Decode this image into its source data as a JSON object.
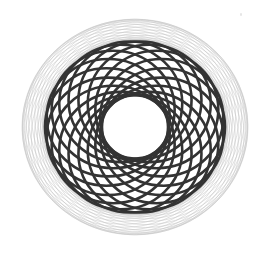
{
  "image": {
    "width": 269,
    "height": 253,
    "background": "#ffffff",
    "subject": "spirograph rosette pattern"
  },
  "rosette": {
    "center": [
      135,
      127
    ],
    "scale_y": 0.955,
    "outer_faint": {
      "count": 22,
      "circle_radius": 102,
      "offset_radius": 11,
      "stroke": "#c4c4c4",
      "stroke_width": 0.7,
      "opacity": 0.75
    },
    "inner_dark": {
      "count": 18,
      "circle_radius": 61.5,
      "offset_radius": 28.5,
      "stroke": "#333333",
      "stroke_width": 2.6,
      "opacity": 1
    },
    "hole_radius": 33
  }
}
